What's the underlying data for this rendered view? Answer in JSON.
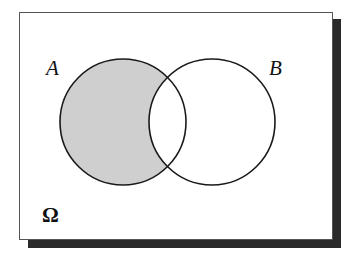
{
  "diagram": {
    "type": "venn",
    "universe": {
      "label": "Ω"
    },
    "sets": [
      {
        "id": "A",
        "label": "A",
        "shaded": true
      },
      {
        "id": "B",
        "label": "B",
        "shaded": false
      }
    ],
    "shaded_region": "A minus B",
    "colors": {
      "shading": "#cfcfcf",
      "outline": "#1a1a1a",
      "shadow": "#2a2a2a",
      "background": "#ffffff"
    }
  }
}
